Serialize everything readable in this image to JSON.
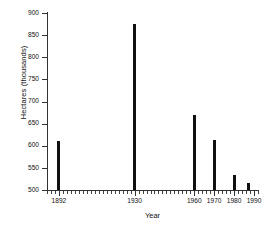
{
  "chart_data": {
    "type": "bar",
    "title": "",
    "xlabel": "Year",
    "ylabel": "Hectares (thousands)",
    "categories": [
      "1892",
      "1930",
      "1960",
      "1970",
      "1980",
      "1987"
    ],
    "x": [
      1892,
      1930,
      1960,
      1970,
      1980,
      1987
    ],
    "values": [
      610,
      875,
      670,
      612,
      533,
      516
    ],
    "xlim": [
      1886,
      1992
    ],
    "ylim": [
      500,
      900
    ],
    "ytick_labels": [
      "500",
      "550",
      "600",
      "650",
      "700",
      "750",
      "800",
      "850",
      "900"
    ],
    "ytick_values": [
      500,
      550,
      600,
      650,
      700,
      750,
      800,
      850,
      900
    ],
    "xtick_labels": [
      "1892",
      "1930",
      "1960",
      "1970",
      "1980",
      "1990"
    ],
    "xtick_values": [
      1892,
      1930,
      1960,
      1970,
      1980,
      1990
    ],
    "xminor_step": 2,
    "grid": false,
    "legend": false,
    "bar_color": "#101010",
    "axis_color": "#333333",
    "background": "#ffffff"
  }
}
